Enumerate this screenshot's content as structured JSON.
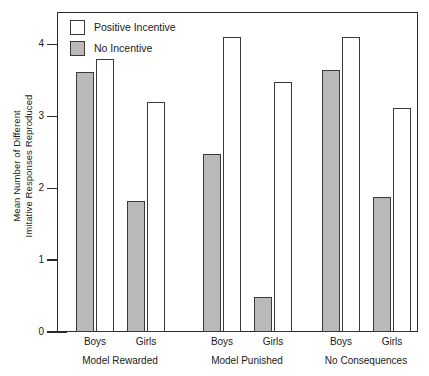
{
  "chart_data": {
    "type": "bar",
    "title": "",
    "xlabel": "",
    "ylabel_line1": "Mean Number of Different",
    "ylabel_line2": "Imitative Responses Reproduced",
    "ylim": [
      0,
      4.45
    ],
    "yticks": [
      0,
      1,
      2,
      3,
      4
    ],
    "ytick_labels": [
      "0",
      "1",
      "2",
      "3",
      "4"
    ],
    "grid": false,
    "legend_position": "top-left",
    "categories": [
      "Boys",
      "Girls",
      "Boys",
      "Girls",
      "Boys",
      "Girls"
    ],
    "groups": [
      {
        "label": "Model Rewarded",
        "subcategories": [
          "Boys",
          "Girls"
        ]
      },
      {
        "label": "Model Punished",
        "subcategories": [
          "Boys",
          "Girls"
        ]
      },
      {
        "label": "No Consequences",
        "subcategories": [
          "Boys",
          "Girls"
        ]
      }
    ],
    "series": [
      {
        "name": "No Incentive",
        "color": "#b9b9b9",
        "values": [
          3.62,
          1.82,
          2.47,
          0.48,
          3.64,
          1.88
        ]
      },
      {
        "name": "Positive Incentive",
        "color": "#ffffff",
        "values": [
          3.8,
          3.2,
          4.1,
          3.47,
          4.1,
          3.12
        ]
      }
    ],
    "bars": [
      {
        "group": "Model Rewarded",
        "sex": "Boys",
        "series": "No Incentive",
        "value": 3.62
      },
      {
        "group": "Model Rewarded",
        "sex": "Boys",
        "series": "Positive Incentive",
        "value": 3.8
      },
      {
        "group": "Model Rewarded",
        "sex": "Girls",
        "series": "No Incentive",
        "value": 1.82
      },
      {
        "group": "Model Rewarded",
        "sex": "Girls",
        "series": "Positive Incentive",
        "value": 3.2
      },
      {
        "group": "Model Punished",
        "sex": "Boys",
        "series": "No Incentive",
        "value": 2.47
      },
      {
        "group": "Model Punished",
        "sex": "Boys",
        "series": "Positive Incentive",
        "value": 4.1
      },
      {
        "group": "Model Punished",
        "sex": "Girls",
        "series": "No Incentive",
        "value": 0.48
      },
      {
        "group": "Model Punished",
        "sex": "Girls",
        "series": "Positive Incentive",
        "value": 3.47
      },
      {
        "group": "No Consequences",
        "sex": "Boys",
        "series": "No Incentive",
        "value": 3.64
      },
      {
        "group": "No Consequences",
        "sex": "Boys",
        "series": "Positive Incentive",
        "value": 4.1
      },
      {
        "group": "No Consequences",
        "sex": "Girls",
        "series": "No Incentive",
        "value": 1.88
      },
      {
        "group": "No Consequences",
        "sex": "Girls",
        "series": "Positive Incentive",
        "value": 3.12
      }
    ]
  },
  "legend": {
    "items": [
      {
        "label": "Positive Incentive",
        "swatch": "white"
      },
      {
        "label": "No Incentive",
        "swatch": "gray"
      }
    ]
  }
}
